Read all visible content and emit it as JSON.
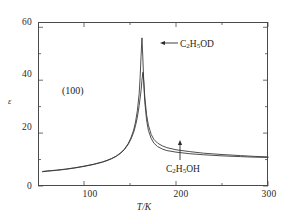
{
  "chart_data": {
    "type": "line",
    "title": "",
    "xlabel": "T/K",
    "ylabel": "ε",
    "xlim": [
      50,
      300
    ],
    "ylim": [
      0,
      62
    ],
    "grid": false,
    "legend_position": "inline-annotations",
    "xticks": [
      100,
      200,
      300
    ],
    "xtick_labels": [
      "100",
      "200",
      "300"
    ],
    "xminor_ticks": [
      150,
      250
    ],
    "yticks": [
      0,
      20,
      40,
      60
    ],
    "ytick_labels": [
      "0",
      "20",
      "40",
      "60"
    ],
    "yminor_ticks": [
      10,
      30,
      50
    ],
    "annotations": [
      {
        "id": "plane",
        "text": "(100)",
        "x": 95,
        "y": 33
      },
      {
        "id": "od",
        "text": "C2H5OD",
        "html": "C<sub>2</sub>H<sub>5</sub>OD",
        "arrow": "left",
        "points_to_x": 166,
        "points_to_y": 50
      },
      {
        "id": "oh",
        "text": "C2H5OH",
        "html": "C<sub>2</sub>H<sub>5</sub>OH",
        "arrow": "up",
        "points_to_x": 183,
        "points_to_y": 17
      }
    ],
    "series": [
      {
        "name": "C2H5OD",
        "color": "#3a3a3a",
        "peak_x": 163,
        "peak_y": 56,
        "points": [
          [
            55,
            5.5
          ],
          [
            60,
            5.7
          ],
          [
            70,
            6.0
          ],
          [
            80,
            6.4
          ],
          [
            90,
            6.9
          ],
          [
            100,
            7.5
          ],
          [
            110,
            8.2
          ],
          [
            120,
            9.1
          ],
          [
            125,
            9.7
          ],
          [
            130,
            10.4
          ],
          [
            135,
            11.3
          ],
          [
            140,
            12.6
          ],
          [
            144,
            14.0
          ],
          [
            148,
            16.0
          ],
          [
            151,
            18.2
          ],
          [
            154,
            21.2
          ],
          [
            156,
            24.2
          ],
          [
            158,
            28.5
          ],
          [
            160,
            35.0
          ],
          [
            161,
            41.0
          ],
          [
            162,
            49.0
          ],
          [
            163,
            56.0
          ],
          [
            164,
            48.0
          ],
          [
            165,
            39.0
          ],
          [
            166,
            32.0
          ],
          [
            168,
            25.0
          ],
          [
            170,
            21.0
          ],
          [
            173,
            18.0
          ],
          [
            176,
            16.2
          ],
          [
            180,
            14.9
          ],
          [
            185,
            14.0
          ],
          [
            190,
            13.4
          ],
          [
            200,
            12.8
          ],
          [
            215,
            12.2
          ],
          [
            230,
            11.8
          ],
          [
            250,
            11.4
          ],
          [
            270,
            11.1
          ],
          [
            285,
            10.9
          ],
          [
            300,
            10.8
          ]
        ]
      },
      {
        "name": "C2H5OH",
        "color": "#3a3a3a",
        "peak_x": 164,
        "peak_y": 43,
        "points": [
          [
            55,
            5.4
          ],
          [
            60,
            5.6
          ],
          [
            70,
            5.9
          ],
          [
            80,
            6.3
          ],
          [
            90,
            6.8
          ],
          [
            100,
            7.4
          ],
          [
            110,
            8.1
          ],
          [
            120,
            9.0
          ],
          [
            125,
            9.6
          ],
          [
            130,
            10.3
          ],
          [
            135,
            11.2
          ],
          [
            140,
            12.4
          ],
          [
            144,
            13.8
          ],
          [
            148,
            15.7
          ],
          [
            151,
            17.7
          ],
          [
            154,
            20.3
          ],
          [
            156,
            22.8
          ],
          [
            158,
            26.0
          ],
          [
            160,
            30.5
          ],
          [
            162,
            36.0
          ],
          [
            163,
            40.0
          ],
          [
            164,
            43.0
          ],
          [
            165,
            39.5
          ],
          [
            166,
            34.0
          ],
          [
            168,
            27.0
          ],
          [
            170,
            23.0
          ],
          [
            173,
            19.5
          ],
          [
            176,
            17.6
          ],
          [
            180,
            16.2
          ],
          [
            185,
            15.2
          ],
          [
            190,
            14.5
          ],
          [
            200,
            13.7
          ],
          [
            215,
            13.0
          ],
          [
            230,
            12.4
          ],
          [
            250,
            11.9
          ],
          [
            270,
            11.5
          ],
          [
            285,
            11.2
          ],
          [
            300,
            11.0
          ]
        ]
      }
    ]
  },
  "axes": {
    "y_label": "ε",
    "x_label": "T/K",
    "y_tick_labels": [
      "60",
      "40",
      "20",
      "0"
    ],
    "x_tick_labels": [
      "100",
      "200",
      "300"
    ]
  },
  "labels": {
    "plane": "(100)",
    "compound_od": "C2H5OD",
    "compound_oh": "C2H5OH"
  }
}
